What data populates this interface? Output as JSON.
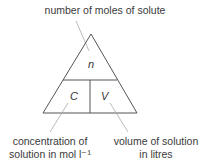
{
  "diagram": {
    "title_label": "number of moles of solute",
    "cells": {
      "top": "n",
      "bottom_left": "C",
      "bottom_right": "V"
    },
    "bottom_left_label": [
      "concentration of",
      "solution in mol l⁻¹"
    ],
    "bottom_right_label": [
      "volume of solution",
      "in litres"
    ],
    "colors": {
      "line": "#555555",
      "leader": "#aaaaaa",
      "text": "#3a3a3a"
    }
  }
}
